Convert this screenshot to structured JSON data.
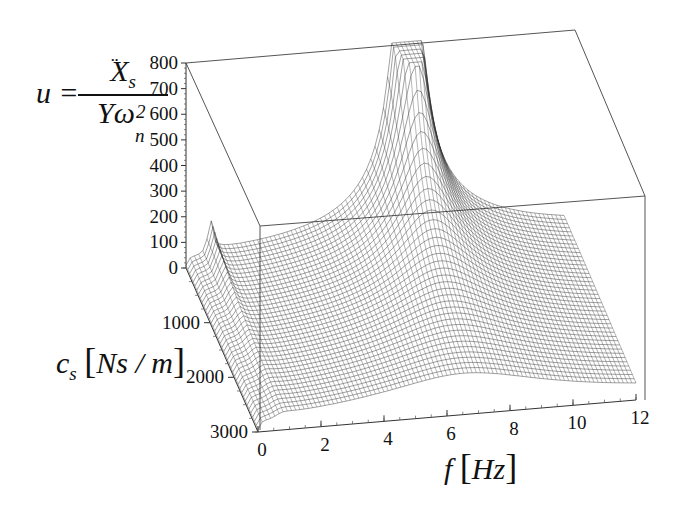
{
  "chart_data": {
    "type": "surface3d",
    "title": "",
    "z_label": "u = Ẍ_s / (Y ω_n^2)",
    "z_label_parts": {
      "lhs": "u =",
      "numerator": "X",
      "numerator_sub": "s",
      "den_main": "Yω",
      "den_sub": "n",
      "den_sup": "2"
    },
    "y_label": "c_s [Ns / m]",
    "y_label_parts": {
      "var": "c",
      "sub": "s",
      "unit": "Ns / m"
    },
    "x_label": "f [Hz]",
    "x_label_parts": {
      "var": "f",
      "unit": "Hz"
    },
    "z_ticks": [
      "0",
      "100",
      "200",
      "300",
      "400",
      "500",
      "600",
      "700",
      "800"
    ],
    "y_ticks": [
      "1000",
      "2000",
      "3000"
    ],
    "x_ticks": [
      "0",
      "2",
      "4",
      "6",
      "8",
      "10",
      "12"
    ],
    "zlim": [
      0,
      800
    ],
    "ylim": [
      0,
      3000
    ],
    "xlim": [
      0,
      12
    ],
    "grid": false,
    "box": true,
    "style": "wireframe mesh, black lines on white",
    "features": [
      {
        "name": "low-frequency resonance peak",
        "f_hz": 0.6,
        "cs": 0,
        "u_peak": 800
      },
      {
        "name": "high-frequency resonance peak",
        "f_hz": 7.0,
        "cs": 0,
        "u_peak": 790
      },
      {
        "name": "high damping plateau",
        "cs": 3000,
        "u_range": [
          50,
          200
        ]
      }
    ],
    "sample_profiles": {
      "x": [
        0,
        1,
        2,
        3,
        4,
        5,
        6,
        7,
        8,
        9,
        10,
        11,
        12
      ],
      "series": [
        {
          "name": "c_s = 0",
          "values": [
            20,
            780,
            160,
            120,
            120,
            150,
            260,
            790,
            240,
            150,
            110,
            80,
            60
          ]
        },
        {
          "name": "c_s = 1000",
          "values": [
            20,
            300,
            150,
            130,
            130,
            150,
            220,
            320,
            230,
            160,
            120,
            90,
            70
          ]
        },
        {
          "name": "c_s = 3000",
          "values": [
            20,
            150,
            120,
            110,
            110,
            120,
            150,
            180,
            170,
            150,
            120,
            100,
            80
          ]
        }
      ]
    }
  }
}
